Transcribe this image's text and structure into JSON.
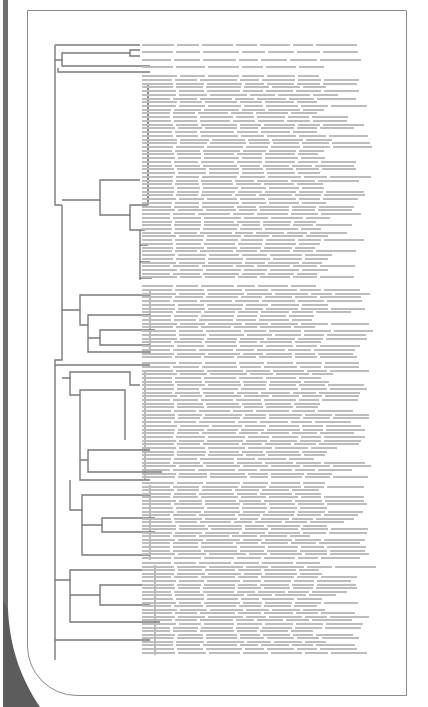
{
  "figure": {
    "type": "phylogenetic-tree",
    "orientation": "rectangular-left-to-right",
    "label_text_legible": false,
    "label_text_visible_fragments": [
      "Lama glama",
      "Australia",
      "New South Wales"
    ],
    "approx_leaf_count": 180,
    "clades": [
      {
        "name": "outgroup",
        "leaf_start_y": 44,
        "leaf_end_y": 73,
        "leaves": 4
      },
      {
        "name": "clade-A",
        "leaf_start_y": 75,
        "leaf_end_y": 280,
        "leaves": 55
      },
      {
        "name": "clade-B",
        "leaf_start_y": 285,
        "leaf_end_y": 360,
        "leaves": 20
      },
      {
        "name": "clade-C",
        "leaf_start_y": 362,
        "leaf_end_y": 480,
        "leaves": 32
      },
      {
        "name": "clade-D",
        "leaf_start_y": 482,
        "leaf_end_y": 560,
        "leaves": 22
      },
      {
        "name": "clade-E",
        "leaf_start_y": 562,
        "leaf_end_y": 655,
        "leaves": 26
      }
    ]
  },
  "colors": {
    "lines": "#7a7a7a",
    "labels": "#bdbdbd",
    "frame": "#8a8a8a",
    "stripe": "#6e6e6e"
  }
}
